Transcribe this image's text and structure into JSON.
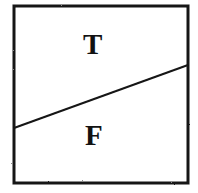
{
  "figure": {
    "type": "line-diagram",
    "background_color": "#ffffff",
    "ink_color": "#141414"
  },
  "frame": {
    "name": "bounding-box",
    "shape": "rectangle",
    "left": 14,
    "top": 6,
    "right": 188,
    "bottom": 183,
    "width": 174,
    "height": 177,
    "stroke_width": 3,
    "stroke_color": "#141414",
    "fill": "#ffffff"
  },
  "divider": {
    "name": "diagonal-divider-line",
    "shape": "line",
    "x1": 14,
    "y1": 128,
    "x2": 188,
    "y2": 65,
    "stroke_width": 2,
    "stroke_color": "#141414",
    "slope_direction": "ascending-left-to-right"
  },
  "regions": [
    {
      "id": "upper",
      "label": "T",
      "meaning": "True",
      "position": "above-line",
      "label_x": 95,
      "label_y": 44,
      "font_size": 29,
      "color": "#121212"
    },
    {
      "id": "lower",
      "label": "F",
      "meaning": "False",
      "position": "below-line",
      "label_x": 96,
      "label_y": 135,
      "font_size": 29,
      "color": "#121212"
    }
  ]
}
